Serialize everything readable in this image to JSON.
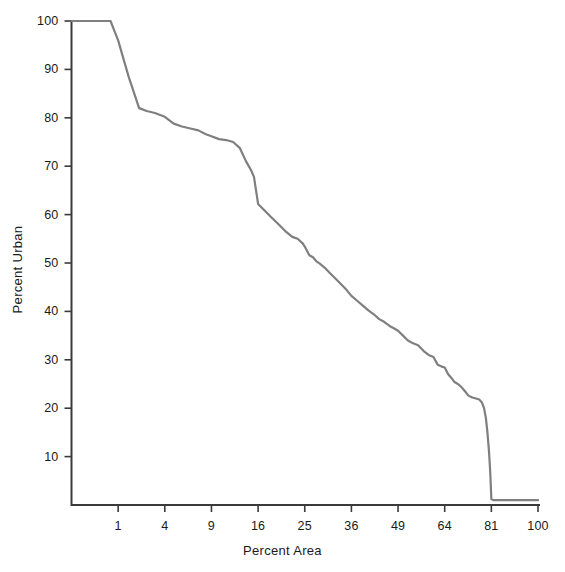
{
  "chart_data": {
    "type": "line",
    "title": "",
    "subtitle": "",
    "xlabel": "Percent Area",
    "ylabel": "Percent Urban",
    "xscale": "sqrt",
    "yscale": "linear",
    "xlim": [
      0,
      100
    ],
    "ylim": [
      0,
      100
    ],
    "grid": false,
    "legend": null,
    "xticks": [
      1,
      4,
      9,
      16,
      25,
      36,
      49,
      64,
      81,
      100
    ],
    "xtick_labels": [
      "1",
      "4",
      "9",
      "16",
      "25",
      "36",
      "49",
      "64",
      "81",
      "100"
    ],
    "yticks": [
      10,
      20,
      30,
      40,
      50,
      60,
      70,
      80,
      90,
      100
    ],
    "ytick_labels": [
      "10",
      "20",
      "30",
      "40",
      "50",
      "60",
      "70",
      "80",
      "90",
      "100"
    ],
    "series": [
      {
        "name": "Percent Urban",
        "color": "#7f7f7f",
        "linewidth": 2.2,
        "x": [
          0.0,
          0.25,
          0.7,
          1.0,
          1.5,
          2.1,
          2.6,
          3.2,
          4.0,
          4.8,
          5.6,
          6.5,
          7.4,
          8.3,
          9.0,
          10.0,
          11.0,
          12.0,
          13.0,
          14.0,
          14.8,
          15.3,
          16.0,
          17.0,
          18.2,
          19.5,
          21.0,
          22.4,
          23.5,
          24.6,
          25.0,
          26.0,
          26.8,
          27.5,
          28.4,
          29.5,
          30.6,
          32.0,
          33.4,
          34.8,
          36.0,
          37.5,
          39.0,
          40.5,
          42.0,
          43.5,
          45.0,
          46.5,
          48.0,
          49.0,
          50.5,
          52.0,
          53.6,
          55.2,
          57.0,
          58.6,
          60.2,
          61.6,
          63.0,
          64.0,
          65.2,
          66.4,
          67.4,
          68.6,
          69.8,
          71.0,
          72.4,
          73.8,
          75.2,
          76.4,
          77.4,
          78.2,
          78.9,
          79.5,
          80.1,
          80.6,
          81.0,
          82.0,
          85.0,
          90.0,
          95.0,
          100.0
        ],
        "y": [
          100.0,
          100.0,
          100.0,
          96.0,
          88.5,
          82.0,
          81.4,
          81.0,
          80.2,
          78.8,
          78.2,
          77.8,
          77.4,
          76.6,
          76.2,
          75.6,
          75.4,
          75.0,
          73.8,
          71.0,
          69.2,
          67.8,
          62.2,
          61.0,
          59.6,
          58.2,
          56.6,
          55.4,
          55.0,
          54.0,
          53.4,
          51.6,
          51.2,
          50.4,
          49.8,
          49.0,
          48.0,
          46.8,
          45.6,
          44.4,
          43.2,
          42.2,
          41.2,
          40.2,
          39.4,
          38.4,
          37.8,
          37.0,
          36.4,
          36.0,
          35.0,
          34.0,
          33.4,
          33.0,
          31.8,
          31.0,
          30.6,
          29.0,
          28.6,
          28.4,
          27.0,
          26.2,
          25.4,
          25.0,
          24.4,
          23.6,
          22.6,
          22.2,
          22.0,
          21.8,
          21.2,
          20.0,
          18.0,
          15.0,
          11.0,
          6.5,
          1.2,
          1.0,
          1.0,
          1.0,
          1.0,
          1.0
        ]
      }
    ]
  },
  "axes": {
    "axis_color": "#3a3a3a",
    "tick_color": "#3a3a3a",
    "text_color": "#1a1a1a",
    "background": "#ffffff"
  }
}
